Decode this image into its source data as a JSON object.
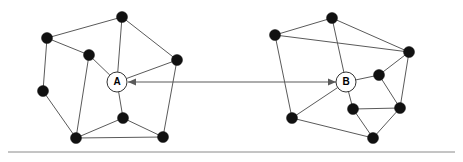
{
  "figure": {
    "width": 463,
    "height": 162,
    "background_color": "#ffffff"
  },
  "style": {
    "node_color": "#111111",
    "edge_color": "#5a5a5a",
    "hub_fill_color": "#ffffff",
    "hub_stroke_color": "#333333",
    "arrow_color": "#5a5a5a",
    "baseline_color": "#8a8a8a",
    "node_radius": 5.5,
    "hub_radius": 10,
    "edge_width": 1
  },
  "left_cluster": {
    "name": "cluster-a",
    "hub": {
      "id": "A",
      "label": "A",
      "x": 117,
      "y": 82,
      "r": 10
    },
    "nodes": [
      {
        "id": "L1",
        "x": 122,
        "y": 17
      },
      {
        "id": "L2",
        "x": 47,
        "y": 38
      },
      {
        "id": "L3",
        "x": 89,
        "y": 55
      },
      {
        "id": "L4",
        "x": 177,
        "y": 60
      },
      {
        "id": "L5",
        "x": 43,
        "y": 91
      },
      {
        "id": "L6",
        "x": 123,
        "y": 118
      },
      {
        "id": "L7",
        "x": 76,
        "y": 138
      },
      {
        "id": "L8",
        "x": 163,
        "y": 137
      }
    ],
    "edges": [
      [
        "L1",
        "L2"
      ],
      [
        "L1",
        "L4"
      ],
      [
        "L1",
        "A"
      ],
      [
        "L2",
        "L3"
      ],
      [
        "L2",
        "L5"
      ],
      [
        "L3",
        "A"
      ],
      [
        "L3",
        "L7"
      ],
      [
        "L4",
        "A"
      ],
      [
        "L4",
        "L8"
      ],
      [
        "L5",
        "L7"
      ],
      [
        "L6",
        "A"
      ],
      [
        "L6",
        "L7"
      ],
      [
        "L6",
        "L8"
      ],
      [
        "L7",
        "L8"
      ]
    ]
  },
  "right_cluster": {
    "name": "cluster-b",
    "hub": {
      "id": "B",
      "label": "B",
      "x": 346,
      "y": 82,
      "r": 10
    },
    "nodes": [
      {
        "id": "R1",
        "x": 332,
        "y": 18
      },
      {
        "id": "R2",
        "x": 275,
        "y": 35
      },
      {
        "id": "R3",
        "x": 409,
        "y": 52
      },
      {
        "id": "R4",
        "x": 379,
        "y": 75
      },
      {
        "id": "R5",
        "x": 353,
        "y": 109
      },
      {
        "id": "R6",
        "x": 400,
        "y": 108
      },
      {
        "id": "R7",
        "x": 292,
        "y": 118
      },
      {
        "id": "R8",
        "x": 373,
        "y": 138
      }
    ],
    "edges": [
      [
        "R1",
        "R2"
      ],
      [
        "R1",
        "R3"
      ],
      [
        "R1",
        "B"
      ],
      [
        "R2",
        "R3"
      ],
      [
        "R2",
        "R7"
      ],
      [
        "R3",
        "R4"
      ],
      [
        "R3",
        "R6"
      ],
      [
        "R4",
        "B"
      ],
      [
        "R4",
        "R6"
      ],
      [
        "R5",
        "B"
      ],
      [
        "R5",
        "R6"
      ],
      [
        "R5",
        "R8"
      ],
      [
        "R6",
        "R8"
      ],
      [
        "R7",
        "B"
      ],
      [
        "R7",
        "R8"
      ]
    ]
  },
  "link": {
    "name": "bidirectional-link",
    "from_label": "A",
    "to_label": "B",
    "x1": 128,
    "x2": 336,
    "y": 82,
    "double_headed": true
  },
  "baseline": {
    "name": "baseline-rule",
    "x1": 8,
    "x2": 455,
    "y": 152
  }
}
